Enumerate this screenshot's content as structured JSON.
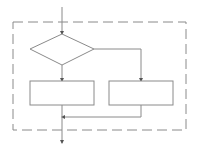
{
  "diagram": {
    "type": "flowchart",
    "colors": {
      "stroke": "#8a8a8a",
      "dashed_border": "#8a8a8a",
      "background": "#ffffff"
    },
    "nodes": [
      {
        "id": "decision",
        "shape": "diamond",
        "label": ""
      },
      {
        "id": "process-left",
        "shape": "rectangle",
        "label": ""
      },
      {
        "id": "process-right",
        "shape": "rectangle",
        "label": ""
      }
    ],
    "edges": [
      {
        "from": "entry",
        "to": "decision"
      },
      {
        "from": "decision",
        "to": "process-left",
        "branch": "bottom"
      },
      {
        "from": "decision",
        "to": "process-right",
        "branch": "right"
      },
      {
        "from": "process-left",
        "to": "merge"
      },
      {
        "from": "process-right",
        "to": "merge"
      },
      {
        "from": "merge",
        "to": "exit"
      }
    ],
    "boundary": {
      "style": "dashed",
      "label": ""
    }
  }
}
